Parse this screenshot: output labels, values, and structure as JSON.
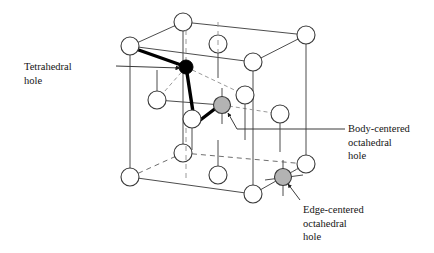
{
  "figure": {
    "background_color": "#ffffff",
    "width": 434,
    "height": 253
  },
  "colors": {
    "line": "#4d4d4d",
    "line_dashed": "#8c8c8c",
    "atom_fill": "#ffffff",
    "atom_stroke": "#3a3a3a",
    "tetrahedral_hole_fill": "#000000",
    "octahedral_hole_fill": "#b3b3b3",
    "octahedral_hole_stroke": "#3a3a3a",
    "bond_bold": "#000000",
    "bond_dashed": "#9a9a9a",
    "leader_line": "#3a3a3a",
    "text": "#141414"
  },
  "labels": {
    "tetrahedral": {
      "id": "tetrahedral-hole",
      "text": "Tetrahedral\nhole",
      "lines": [
        "Tetrahedral",
        "hole"
      ],
      "leader": {
        "from_x": 116,
        "from_y": 66,
        "to_x": 178,
        "to_y": 66
      },
      "arrow": true
    },
    "body_centered": {
      "id": "body-centered-octahedral-hole",
      "text": "Body-centered\noctahedral\nhole",
      "lines": [
        "Body-centered",
        "octahedral",
        "hole"
      ],
      "leader": {
        "from_x": 345,
        "from_y": 129,
        "to_x": 233,
        "to_y": 129
      },
      "arrow": true
    },
    "edge_centered": {
      "id": "edge-centered-octahedral-hole",
      "text": "Edge-centered\noctahedral\nhole",
      "lines": [
        "Edge-centered",
        "octahedral",
        "hole"
      ],
      "leader": {
        "from_x": 300,
        "from_y": 200,
        "to_x": 288,
        "to_y": 183
      },
      "arrow": true
    }
  },
  "lattice": {
    "type": "face-centered-cubic",
    "cube_vertices": {
      "front_top_left": [
        130,
        46
      ],
      "front_top_right": [
        253,
        62
      ],
      "front_bottom_left": [
        130,
        177
      ],
      "front_bottom_right": [
        253,
        194
      ],
      "back_top_left": [
        183,
        22
      ],
      "back_top_right": [
        306,
        35
      ],
      "back_bottom_left": [
        183,
        153
      ],
      "back_bottom_right": [
        306,
        164
      ]
    },
    "atoms": [
      {
        "name": "corner-front-top-left",
        "x": 130,
        "y": 46,
        "r": 9,
        "kind": "lattice"
      },
      {
        "name": "corner-back-top-left",
        "x": 183,
        "y": 22,
        "r": 9,
        "kind": "lattice"
      },
      {
        "name": "corner-back-top-right",
        "x": 306,
        "y": 35,
        "r": 9,
        "kind": "lattice"
      },
      {
        "name": "corner-front-top-right",
        "x": 253,
        "y": 62,
        "r": 9,
        "kind": "lattice"
      },
      {
        "name": "corner-front-bottom-left",
        "x": 130,
        "y": 177,
        "r": 9,
        "kind": "lattice"
      },
      {
        "name": "corner-back-bottom-left",
        "x": 183,
        "y": 153,
        "r": 9,
        "kind": "lattice"
      },
      {
        "name": "corner-back-bottom-right",
        "x": 306,
        "y": 164,
        "r": 9,
        "kind": "lattice"
      },
      {
        "name": "corner-front-bottom-right",
        "x": 253,
        "y": 194,
        "r": 9,
        "kind": "lattice"
      },
      {
        "name": "face-center-top",
        "x": 218,
        "y": 44,
        "r": 9,
        "kind": "lattice"
      },
      {
        "name": "face-center-bottom",
        "x": 218,
        "y": 175,
        "r": 9,
        "kind": "lattice"
      },
      {
        "name": "face-center-left",
        "x": 157,
        "y": 100,
        "r": 9,
        "kind": "lattice"
      },
      {
        "name": "face-center-right",
        "x": 280,
        "y": 114,
        "r": 9,
        "kind": "lattice"
      },
      {
        "name": "face-center-front",
        "x": 192,
        "y": 119,
        "r": 9,
        "kind": "lattice"
      },
      {
        "name": "face-center-back",
        "x": 245,
        "y": 95,
        "r": 9,
        "kind": "lattice"
      }
    ],
    "holes": [
      {
        "name": "tetrahedral-hole",
        "x": 186,
        "y": 67,
        "r": 7,
        "fill": "#000000"
      },
      {
        "name": "body-centered-octahedral-hole",
        "x": 222,
        "y": 105,
        "r": 8.5,
        "fill": "#b3b3b3"
      },
      {
        "name": "edge-centered-octahedral-hole",
        "x": 283,
        "y": 177,
        "r": 8.5,
        "fill": "#b3b3b3"
      }
    ],
    "tetrahedral_bonds": [
      {
        "from": "corner-front-top-left",
        "to": "tetrahedral-hole",
        "style": "bold"
      },
      {
        "from": "tetrahedral-hole",
        "to": "face-center-front",
        "style": "bold"
      },
      {
        "from": "face-center-front",
        "to": "body-centered-octahedral-hole",
        "style": "bold"
      },
      {
        "from": "tetrahedral-hole",
        "to": "face-center-left",
        "style": "dashed"
      },
      {
        "from": "tetrahedral-hole",
        "to": "face-center-back",
        "style": "dashed"
      }
    ],
    "octahedral_bonds": [
      {
        "from": "body-centered-octahedral-hole",
        "to": "face-center-right",
        "style": "dashed"
      },
      {
        "from": "body-centered-octahedral-hole",
        "to": "face-center-left",
        "style": "solid"
      },
      {
        "from": "edge-centered-octahedral-hole",
        "to": "corner-back-bottom-right",
        "style": "dashed"
      }
    ]
  }
}
